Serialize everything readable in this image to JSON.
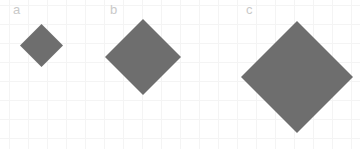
{
  "figure": {
    "width": 360,
    "height": 149,
    "background_color": "#ffffff",
    "grid": {
      "visible": true,
      "spacing_px": 19,
      "origin_x_px": 9,
      "origin_y_px": 5,
      "line_color": "#f4f4f4"
    },
    "shape_fill_color": "#6e6e6e",
    "label_color": "#c9c9c9"
  },
  "panels": [
    {
      "label": "a",
      "label_x": 13,
      "label_y": 3,
      "shape": "diamond",
      "center_x": 41,
      "center_y": 45,
      "width": 43,
      "height": 43,
      "diagonal_px": 43
    },
    {
      "label": "b",
      "label_x": 110,
      "label_y": 3,
      "shape": "diamond",
      "center_x": 143,
      "center_y": 57,
      "width": 76,
      "height": 76,
      "diagonal_px": 76
    },
    {
      "label": "c",
      "label_x": 246,
      "label_y": 3,
      "shape": "diamond",
      "center_x": 297,
      "center_y": 77,
      "width": 112,
      "height": 112,
      "diagonal_px": 112
    }
  ]
}
